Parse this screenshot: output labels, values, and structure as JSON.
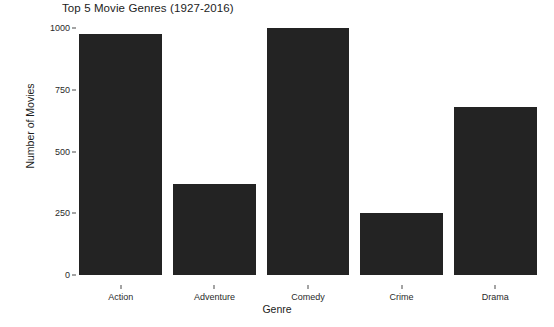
{
  "chart_data": {
    "type": "bar",
    "title": "Top 5 Movie Genres (1927-2016)",
    "xlabel": "Genre",
    "ylabel": "Number of Movies",
    "categories": [
      "Action",
      "Adventure",
      "Comedy",
      "Crime",
      "Drama"
    ],
    "values": [
      975,
      368,
      1000,
      250,
      682
    ],
    "ylim": [
      0,
      1000
    ],
    "yticks": [
      0,
      250,
      500,
      750,
      1000
    ],
    "ytick_labels": [
      "0",
      "250",
      "500",
      "750",
      "1000"
    ],
    "grid": false,
    "legend": null,
    "bar_color": "#232323",
    "background_color": "#ffffff"
  }
}
